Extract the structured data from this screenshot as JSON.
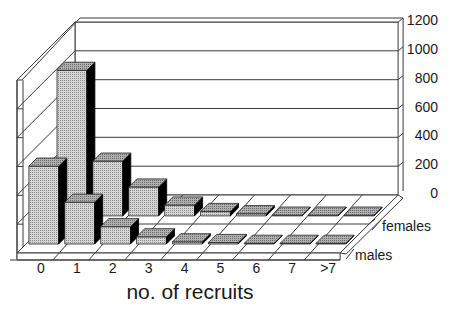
{
  "chart_data": {
    "type": "bar",
    "subtype": "3d-clustered-depth",
    "title": "",
    "xlabel": "no. of recruits",
    "ylabel": "",
    "categories": [
      "0",
      "1",
      "2",
      "3",
      "4",
      "5",
      "6",
      "7",
      ">7"
    ],
    "series": [
      {
        "name": "males",
        "values": [
          540,
          290,
          120,
          50,
          15,
          10,
          5,
          5,
          5
        ]
      },
      {
        "name": "females",
        "values": [
          1010,
          380,
          200,
          75,
          30,
          15,
          5,
          5,
          5
        ]
      }
    ],
    "yticks": [
      0,
      200,
      400,
      600,
      800,
      1000,
      1200
    ],
    "ylim": [
      0,
      1200
    ],
    "y_axis_position": "right",
    "grid": true,
    "legend": "series labels at right of depth axis (females back, males front)"
  },
  "colors": {
    "bar_front": "#c4c4c4",
    "bar_top": "#9a9a9a",
    "bar_side": "#000000",
    "floor_tile": "#a8a8a8",
    "line": "#3a3a3a",
    "background": "#ffffff"
  }
}
